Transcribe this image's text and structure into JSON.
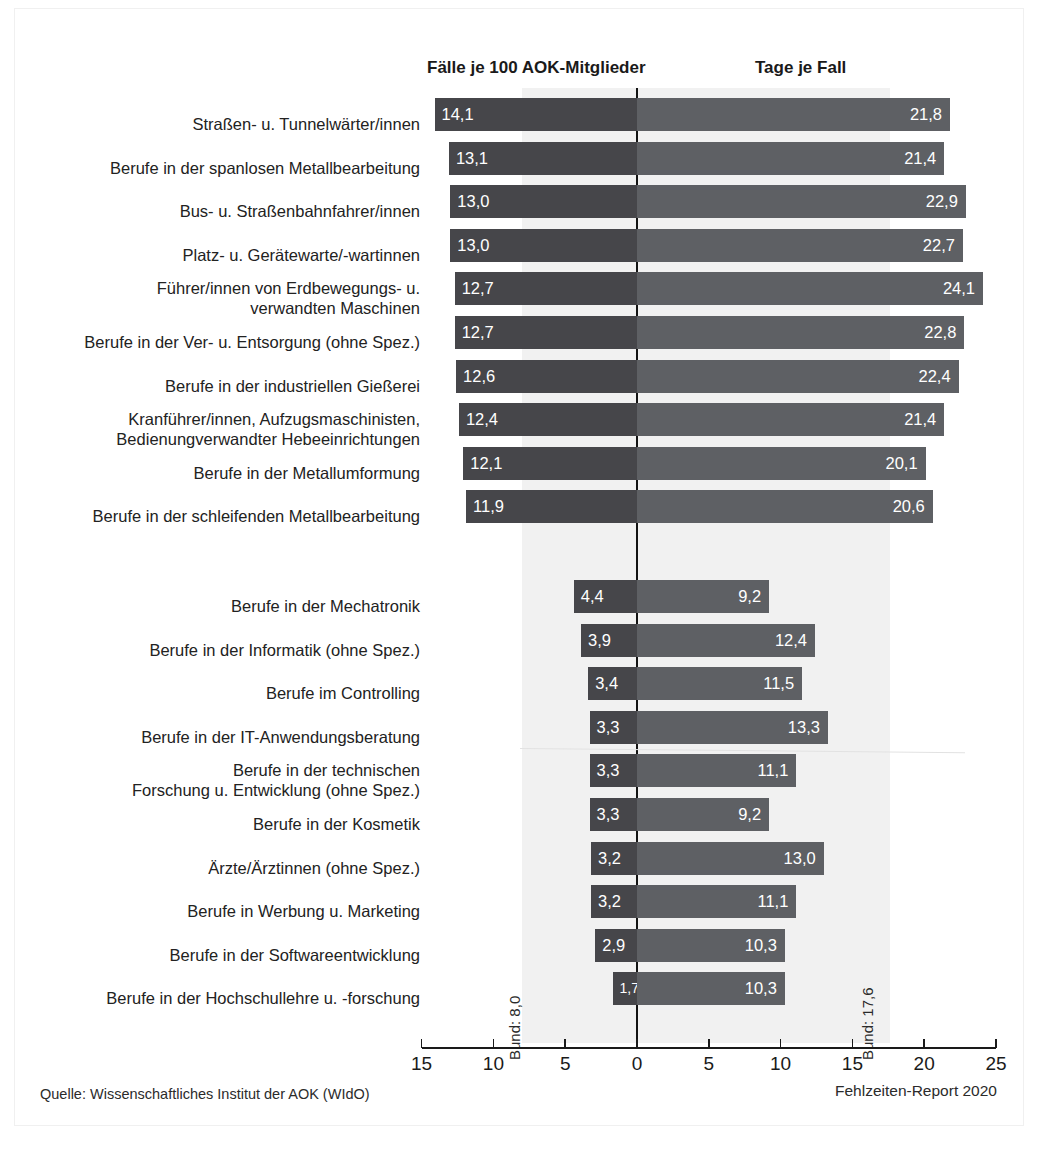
{
  "headers": {
    "left": "Fälle je 100 AOK-Mitglieder",
    "right": "Tage je Fall"
  },
  "annotations": {
    "bund_left": "Bund: 8,0",
    "bund_right": "Bund: 17,6"
  },
  "footer": {
    "source": "Quelle: Wissenschaftliches Institut der AOK (WIdO)",
    "report": "Fehlzeiten-Report 2020"
  },
  "axis": {
    "tick_labels": [
      "15",
      "10",
      "5",
      "0",
      "5",
      "10",
      "15",
      "20",
      "25"
    ],
    "tick_values": [
      -15,
      -10,
      -5,
      0,
      5,
      10,
      15,
      20,
      25
    ]
  },
  "colors": {
    "bar_left": "#46464a",
    "bar_right": "#5e6064",
    "band": "#f1f1f1",
    "zero_line": "#131313",
    "text": "#1c1c1c"
  },
  "chart_data": {
    "type": "bar",
    "title": "",
    "subtitle": "",
    "xlabel": "",
    "ylabel": "",
    "grid": false,
    "legend_position": "top",
    "orientation": "horizontal",
    "diverging": true,
    "xlim": [
      -15,
      25
    ],
    "xticks": [
      -15,
      -10,
      -5,
      0,
      5,
      10,
      15,
      20,
      25
    ],
    "xtick_labels": [
      "15",
      "10",
      "5",
      "0",
      "5",
      "10",
      "15",
      "20",
      "25"
    ],
    "series": [
      {
        "name": "Fälle je 100 AOK-Mitglieder",
        "direction": "left",
        "reference": 8.0,
        "reference_label": "Bund: 8,0"
      },
      {
        "name": "Tage je Fall",
        "direction": "right",
        "reference": 17.6,
        "reference_label": "Bund: 17,6"
      }
    ],
    "groups": [
      {
        "name": "high",
        "categories": [
          "Straßen- u. Tunnelwärter/innen",
          "Berufe in der spanlosen Metallbearbeitung",
          "Bus- u. Straßenbahnfahrer/innen",
          "Platz- u. Gerätewarte/-wartinnen",
          "Führer/innen von Erdbewegungs- u.\nverwandten Maschinen",
          "Berufe in der Ver- u. Entsorgung (ohne Spez.)",
          "Berufe in der industriellen Gießerei",
          "Kranführer/innen, Aufzugsmaschinisten,\nBedienungverwandter Hebeeinrichtungen",
          "Berufe in der Metallumformung",
          "Berufe in der schleifenden Metallbearbeitung"
        ],
        "faelle": [
          14.1,
          13.1,
          13.0,
          13.0,
          12.7,
          12.7,
          12.6,
          12.4,
          12.1,
          11.9
        ],
        "tage": [
          21.8,
          21.4,
          22.9,
          22.7,
          24.1,
          22.8,
          22.4,
          21.4,
          20.1,
          20.6
        ],
        "faelle_labels": [
          "14,1",
          "13,1",
          "13,0",
          "13,0",
          "12,7",
          "12,7",
          "12,6",
          "12,4",
          "12,1",
          "11,9"
        ],
        "tage_labels": [
          "21,8",
          "21,4",
          "22,9",
          "22,7",
          "24,1",
          "22,8",
          "22,4",
          "21,4",
          "20,1",
          "20,6"
        ]
      },
      {
        "name": "low",
        "categories": [
          "Berufe in der Mechatronik",
          "Berufe in der Informatik (ohne Spez.)",
          "Berufe im Controlling",
          "Berufe in der IT-Anwendungsberatung",
          "Berufe in der technischen\nForschung u. Entwicklung (ohne Spez.)",
          "Berufe in der Kosmetik",
          "Ärzte/Ärztinnen (ohne Spez.)",
          "Berufe in Werbung u. Marketing",
          "Berufe in der Softwareentwicklung",
          "Berufe in der Hochschullehre u. -forschung"
        ],
        "faelle": [
          4.4,
          3.9,
          3.4,
          3.3,
          3.3,
          3.3,
          3.2,
          3.2,
          2.9,
          1.7
        ],
        "tage": [
          9.2,
          12.4,
          11.5,
          13.3,
          11.1,
          9.2,
          13.0,
          11.1,
          10.3,
          10.3
        ],
        "faelle_labels": [
          "4,4",
          "3,9",
          "3,4",
          "3,3",
          "3,3",
          "3,3",
          "3,2",
          "3,2",
          "2,9",
          "1,7"
        ],
        "tage_labels": [
          "9,2",
          "12,4",
          "11,5",
          "13,3",
          "11,1",
          "9,2",
          "13,0",
          "11,1",
          "10,3",
          "10,3"
        ]
      }
    ]
  }
}
